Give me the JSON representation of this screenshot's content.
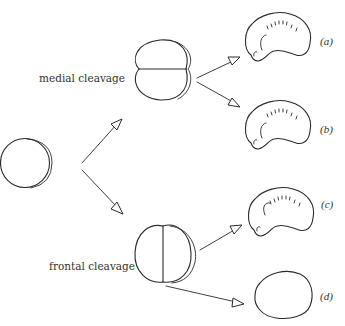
{
  "diagram": {
    "labels": {
      "medial": "medial cleavage",
      "frontal": "frontal cleavage"
    },
    "outcomes": [
      {
        "tag": "(a)",
        "form": "normal-embryo"
      },
      {
        "tag": "(b)",
        "form": "normal-embryo"
      },
      {
        "tag": "(c)",
        "form": "normal-embryo"
      },
      {
        "tag": "(d)",
        "form": "undifferentiated-blob"
      }
    ],
    "nodes": {
      "egg": "uncleaved-egg",
      "medial_embryo": "two-cell-medial-division",
      "frontal_embryo": "two-cell-frontal-division"
    },
    "colors": {
      "ink": "#2a2a2a",
      "background": "#ffffff"
    }
  }
}
